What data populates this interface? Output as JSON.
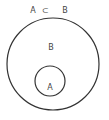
{
  "diagram": {
    "title": "A ⊂ B",
    "title_parts": {
      "left": "A",
      "symbol": "⊂",
      "right": "B"
    },
    "outer_set": {
      "label": "B"
    },
    "inner_set": {
      "label": "A"
    },
    "stroke_color": "#333333"
  }
}
